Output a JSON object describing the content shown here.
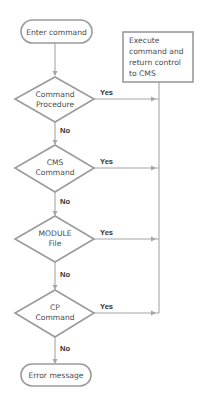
{
  "diagram": {
    "type": "flowchart",
    "colors": {
      "shape_stroke": "#9a9a9a",
      "edge_stroke": "#a6a6a6",
      "text": "#4a4a4a",
      "label": "#333333",
      "background": "#ffffff"
    },
    "start": {
      "shape": "rounded-rectangle",
      "label": "Enter command"
    },
    "decisions": [
      {
        "lines": [
          "Command",
          "Procedure"
        ],
        "yes_label": "Yes",
        "no_label": "No"
      },
      {
        "lines": [
          "CMS",
          "Command"
        ],
        "yes_label": "Yes",
        "no_label": "No"
      },
      {
        "lines": [
          "MODULE",
          "File"
        ],
        "yes_label": "Yes",
        "no_label": "No"
      },
      {
        "lines": [
          "CP",
          "Command"
        ],
        "yes_label": "Yes",
        "no_label": "No"
      }
    ],
    "process": {
      "shape": "rectangle",
      "lines": [
        "Execute",
        "command and",
        "return control",
        "to CMS"
      ]
    },
    "end": {
      "shape": "rounded-rectangle",
      "label": "Error message"
    }
  }
}
